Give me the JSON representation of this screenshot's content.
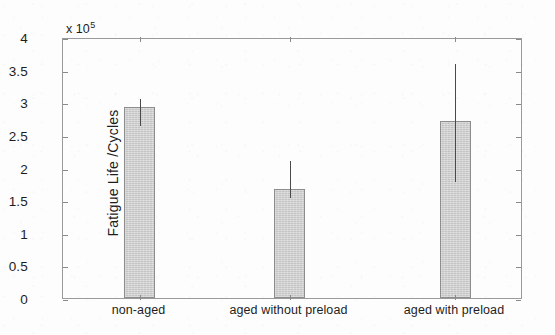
{
  "figure": {
    "background_color": "#fdfdfd",
    "axis_color": "#9a9a9a",
    "bar_fill_color": "#c9c9c9",
    "bar_edge_color": "#8d8d8d",
    "errorbar_color": "#4a4a4a",
    "exponent_prefix": "x 10",
    "exponent_power": "5"
  },
  "chart_data": {
    "type": "bar",
    "title": "",
    "xlabel": "",
    "ylabel": "Fatigue Life /Cycles",
    "categories": [
      "non-aged",
      "aged without preload",
      "aged with preload"
    ],
    "values": [
      293000,
      167000,
      271000
    ],
    "value_scale": 100000,
    "values_scaled": [
      2.93,
      1.67,
      2.71
    ],
    "error_low": [
      267000,
      156000,
      181000
    ],
    "error_high": [
      308000,
      213000,
      362000
    ],
    "error_low_scaled": [
      2.67,
      1.56,
      1.81
    ],
    "error_high_scaled": [
      3.08,
      2.13,
      3.62
    ],
    "ylim": [
      0,
      400000
    ],
    "ylim_scaled": [
      0,
      4
    ],
    "ytick_labels": [
      "0",
      "0.5",
      "1",
      "1.5",
      "2",
      "2.5",
      "3",
      "3.5",
      "4"
    ],
    "ytick_values": [
      0,
      0.5,
      1,
      1.5,
      2,
      2.5,
      3,
      3.5,
      4
    ],
    "grid": false,
    "legend": "none",
    "errorbars": true,
    "errorbar_style": "line-no-caps"
  }
}
